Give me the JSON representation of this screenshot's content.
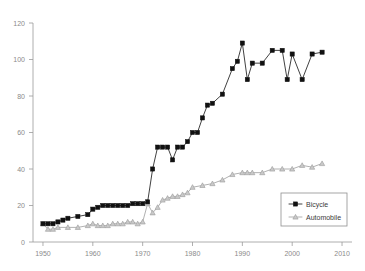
{
  "chart_data": {
    "type": "line",
    "title": "",
    "subtitle": "",
    "xlabel": "",
    "ylabel": "",
    "xlim": [
      1948,
      2012
    ],
    "ylim": [
      0,
      120
    ],
    "grid": false,
    "legend_position": "bottom-right",
    "x_ticks": [
      "1950",
      "1960",
      "1970",
      "1980",
      "1990",
      "2000",
      "2010"
    ],
    "x_tick_values": [
      1950,
      1960,
      1970,
      1980,
      1990,
      2000,
      2010
    ],
    "y_ticks": [
      "0",
      "20",
      "40",
      "60",
      "80",
      "100",
      "120"
    ],
    "y_tick_values": [
      0,
      20,
      40,
      60,
      80,
      100,
      120
    ],
    "series": [
      {
        "name": "Bicycle",
        "marker": "filled-square",
        "color": "#111111",
        "line_color": "#2b2b2b",
        "x": [
          1950,
          1951,
          1952,
          1953,
          1954,
          1955,
          1957,
          1959,
          1960,
          1961,
          1962,
          1963,
          1964,
          1965,
          1966,
          1967,
          1968,
          1969,
          1970,
          1971,
          1972,
          1973,
          1974,
          1975,
          1976,
          1977,
          1978,
          1979,
          1980,
          1981,
          1982,
          1983,
          1984,
          1986,
          1988,
          1989,
          1990,
          1991,
          1992,
          1994,
          1996,
          1998,
          1999,
          2000,
          2002,
          2004,
          2006
        ],
        "values": [
          10,
          10,
          10,
          11,
          12,
          13,
          14,
          15,
          18,
          19,
          20,
          20,
          20,
          20,
          20,
          20,
          21,
          21,
          21,
          22,
          40,
          52,
          52,
          52,
          45,
          52,
          52,
          55,
          60,
          60,
          68,
          75,
          76,
          81,
          95,
          99,
          109,
          89,
          98,
          98,
          105,
          105,
          89,
          103,
          89,
          103,
          104
        ],
        "note": "black filled square markers, solid dark line"
      },
      {
        "name": "Automobile",
        "marker": "open-triangle",
        "color": "#c9c9c9",
        "line_color": "#a8a8a8",
        "x": [
          1950,
          1951,
          1952,
          1953,
          1955,
          1957,
          1959,
          1960,
          1961,
          1962,
          1963,
          1964,
          1965,
          1966,
          1967,
          1968,
          1969,
          1970,
          1971,
          1972,
          1973,
          1974,
          1975,
          1976,
          1977,
          1978,
          1979,
          1980,
          1982,
          1984,
          1986,
          1988,
          1990,
          1991,
          1992,
          1994,
          1996,
          1998,
          2000,
          2002,
          2004,
          2006
        ],
        "values": [
          10,
          7,
          7,
          8,
          8,
          8,
          9,
          10,
          9,
          9,
          9,
          10,
          10,
          10,
          11,
          11,
          10,
          11,
          21,
          16,
          19,
          23,
          24,
          25,
          25,
          26,
          27,
          30,
          31,
          32,
          34,
          37,
          38,
          38,
          38,
          38,
          40,
          40,
          40,
          42,
          41,
          43
        ],
        "note": "gray open triangle markers, gray line"
      }
    ]
  },
  "legend": {
    "items": [
      {
        "label": "Bicycle",
        "marker": "filled-square",
        "color": "#111111"
      },
      {
        "label": "Automobile",
        "marker": "open-triangle",
        "color": "#c9c9c9"
      }
    ]
  },
  "colors": {
    "background": "#ffffff",
    "axis": "#9a9a9a",
    "tick_text": "#8a8a8a",
    "bicycle": "#111111",
    "automobile": "#c9c9c9"
  }
}
